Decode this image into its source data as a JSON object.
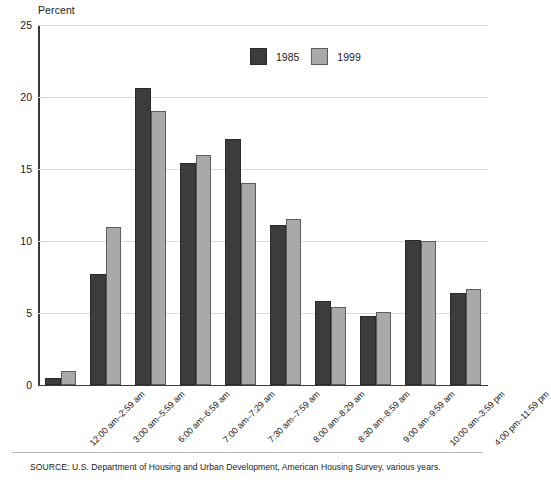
{
  "chart_data": {
    "type": "bar",
    "title": "",
    "ylabel": "Percent",
    "xlabel": "",
    "ylim": [
      0,
      25
    ],
    "yticks": [
      0,
      5,
      10,
      15,
      20,
      25
    ],
    "ytick_labels": [
      "0",
      "5",
      "10",
      "15",
      "20",
      "25"
    ],
    "grid": true,
    "legend_position": "top-center",
    "categories": [
      "12:00 am–2:59 am",
      "3:00 am–5:59 am",
      "6:00 am–6:59 am",
      "7:00 am–7:29 am",
      "7:30 am–7:59 am",
      "8:00 am–8:29 am",
      "8:30 am–8:59 am",
      "9:00 am–9:59 am",
      "10:00 am–3:59 pm",
      "4:00 pm–11:59 pm"
    ],
    "series": [
      {
        "name": "1985",
        "color": "#3c3c3c",
        "values": [
          0.5,
          7.7,
          20.6,
          15.4,
          17.1,
          11.1,
          5.8,
          4.8,
          10.1,
          6.4
        ]
      },
      {
        "name": "1999",
        "color": "#a9a9a9",
        "values": [
          1.0,
          11.0,
          19.0,
          16.0,
          14.0,
          11.5,
          5.4,
          5.1,
          10.0,
          6.7
        ]
      }
    ]
  },
  "legend": {
    "entries": [
      {
        "label": "1985"
      },
      {
        "label": "1999"
      }
    ]
  },
  "footer": {
    "source": "SOURCE: U.S. Department of Housing and Urban Development, American Housing Survey, various years."
  }
}
